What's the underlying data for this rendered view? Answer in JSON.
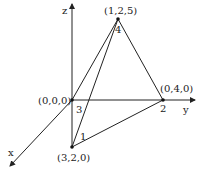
{
  "diagram": {
    "type": "3d-coordinate-tetrahedron",
    "axes": {
      "x_label": "x",
      "y_label": "y",
      "z_label": "z"
    },
    "vertices": [
      {
        "id": "origin",
        "coord_label": "(0,0,0)",
        "number": "3"
      },
      {
        "id": "p1",
        "coord_label": "(3,2,0)",
        "number": "1"
      },
      {
        "id": "p2",
        "coord_label": "(0,4,0)",
        "number": "2"
      },
      {
        "id": "p4",
        "coord_label": "(1,2,5)",
        "number": "4"
      }
    ],
    "edges": [
      [
        "origin",
        "p4"
      ],
      [
        "p1",
        "p4"
      ],
      [
        "p2",
        "p4"
      ],
      [
        "p1",
        "p2"
      ],
      [
        "origin",
        "p1"
      ]
    ]
  }
}
